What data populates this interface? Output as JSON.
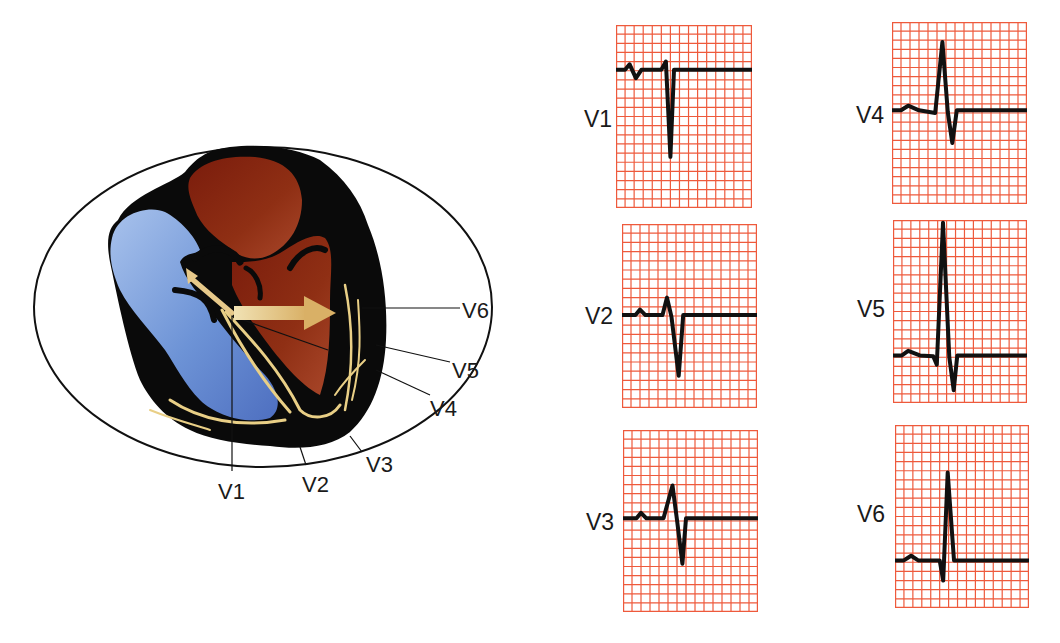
{
  "figure": {
    "colors": {
      "grid": "#ee5a3c",
      "trace": "#111111",
      "right_ventricle": "#6d93d6",
      "left_ventricle": "#8a2a12",
      "myocardium": "#0a0a0a",
      "conduction": "#e9cf86",
      "vector_arrow": "#e7c98a",
      "torso_outline": "#111111"
    }
  },
  "heart_diagram": {
    "lead_labels": {
      "v1": "V1",
      "v2": "V2",
      "v3": "V3",
      "v4": "V4",
      "v5": "V5",
      "v6": "V6"
    },
    "vector_arrow": "mean-QRS-vector-arrow"
  },
  "ecg_panels": [
    {
      "lead": "V1",
      "pattern": "small r, deep S (rS)"
    },
    {
      "lead": "V2",
      "pattern": "rS, larger r"
    },
    {
      "lead": "V3",
      "pattern": "RS transition"
    },
    {
      "lead": "V4",
      "pattern": "R > S"
    },
    {
      "lead": "V5",
      "pattern": "tall R, small q and S (qRs)"
    },
    {
      "lead": "V6",
      "pattern": "qR, no S"
    }
  ],
  "chart_data": {
    "type": "line",
    "xlabel": "time (grid small boxes)",
    "ylabel": "amplitude (grid small boxes, + up)",
    "grid": true,
    "series": [
      {
        "name": "V1",
        "points": [
          [
            0,
            0
          ],
          [
            1,
            0
          ],
          [
            1.5,
            0.6
          ],
          [
            2.2,
            -0.9
          ],
          [
            2.8,
            0
          ],
          [
            5,
            0
          ],
          [
            5.5,
            0.9
          ],
          [
            6,
            -9.5
          ],
          [
            6.4,
            0
          ],
          [
            15,
            0
          ]
        ]
      },
      {
        "name": "V2",
        "points": [
          [
            0,
            0
          ],
          [
            1.5,
            0
          ],
          [
            2,
            0.6
          ],
          [
            2.6,
            0
          ],
          [
            4.5,
            0
          ],
          [
            5,
            1.9
          ],
          [
            5.5,
            -0.2
          ],
          [
            6.3,
            -6.6
          ],
          [
            6.8,
            0
          ],
          [
            15,
            0
          ]
        ]
      },
      {
        "name": "V3",
        "points": [
          [
            0,
            0
          ],
          [
            1.5,
            0
          ],
          [
            2,
            0.6
          ],
          [
            2.6,
            0
          ],
          [
            4.5,
            0
          ],
          [
            5.5,
            3.6
          ],
          [
            6,
            -0.2
          ],
          [
            6.6,
            -5
          ],
          [
            7,
            0
          ],
          [
            15,
            0
          ]
        ]
      },
      {
        "name": "V4",
        "points": [
          [
            0,
            0
          ],
          [
            1,
            0
          ],
          [
            1.8,
            0.5
          ],
          [
            3,
            0
          ],
          [
            4.8,
            -0.3
          ],
          [
            5.6,
            7.5
          ],
          [
            6.2,
            -0.2
          ],
          [
            6.7,
            -3.6
          ],
          [
            7.2,
            0
          ],
          [
            15,
            0
          ]
        ]
      },
      {
        "name": "V5",
        "points": [
          [
            0,
            0
          ],
          [
            1,
            0
          ],
          [
            1.7,
            0.5
          ],
          [
            3,
            0
          ],
          [
            4.5,
            -0.1
          ],
          [
            4.9,
            -1
          ],
          [
            5.6,
            14.5
          ],
          [
            6.3,
            -0.2
          ],
          [
            6.8,
            -3.8
          ],
          [
            7.2,
            0
          ],
          [
            15,
            0
          ]
        ]
      },
      {
        "name": "V6",
        "points": [
          [
            0,
            0
          ],
          [
            1,
            0
          ],
          [
            1.8,
            0.5
          ],
          [
            2.6,
            0
          ],
          [
            5,
            0
          ],
          [
            5.4,
            -2.2
          ],
          [
            5.9,
            9.6
          ],
          [
            6.6,
            0
          ],
          [
            15,
            0
          ]
        ]
      }
    ]
  }
}
